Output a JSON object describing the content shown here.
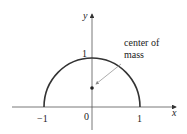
{
  "figure": {
    "axis_labels": {
      "x": "x",
      "y": "y"
    },
    "ticks": {
      "y_one": "1",
      "x_neg_one": "−1",
      "origin": "0",
      "x_one": "1"
    },
    "annotation": {
      "line1": "center of",
      "line2": "mass"
    }
  },
  "colors": {
    "curve": "#333333",
    "axis": "#555555",
    "text": "#222222",
    "pointer": "#888888"
  }
}
